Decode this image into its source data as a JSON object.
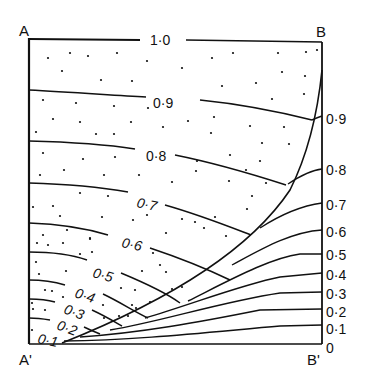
{
  "corners": {
    "top_left": "A",
    "top_right": "B",
    "bottom_left": "A'",
    "bottom_right": "B'"
  },
  "colors": {
    "ink": "#111111",
    "background": "#ffffff"
  },
  "left_region_labels": [
    {
      "value": "1·0",
      "x": 150,
      "y": 44
    },
    {
      "value": "0·9",
      "x": 152,
      "y": 107
    },
    {
      "value": "0·8",
      "x": 145,
      "y": 160
    },
    {
      "value": "0·7",
      "x": 135,
      "y": 205
    },
    {
      "value": "0·6",
      "x": 120,
      "y": 245
    },
    {
      "value": "0·5",
      "x": 92,
      "y": 277
    },
    {
      "value": "0·4",
      "x": 75,
      "y": 296
    },
    {
      "value": "0·3",
      "x": 63,
      "y": 311
    },
    {
      "value": "0·2",
      "x": 55,
      "y": 326
    },
    {
      "value": "0·1",
      "x": 37,
      "y": 342
    }
  ],
  "right_edge_labels": [
    {
      "value": "0·9",
      "y": 123
    },
    {
      "value": "0·8",
      "y": 174
    },
    {
      "value": "0·7",
      "y": 209
    },
    {
      "value": "0·6",
      "y": 236
    },
    {
      "value": "0·5",
      "y": 259
    },
    {
      "value": "0·4",
      "y": 279
    },
    {
      "value": "0·3",
      "y": 298
    },
    {
      "value": "0·2",
      "y": 316
    },
    {
      "value": "0·1",
      "y": 333
    },
    {
      "value": "0",
      "y": 352
    }
  ]
}
